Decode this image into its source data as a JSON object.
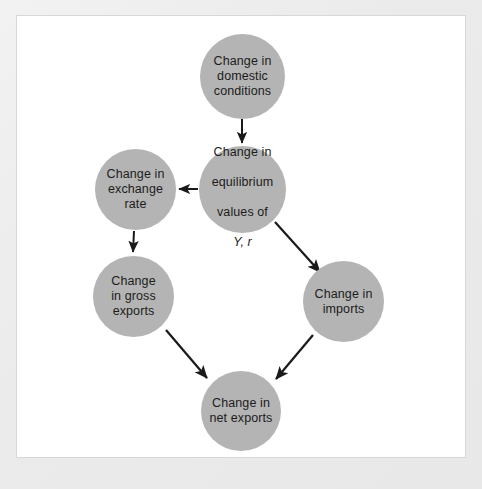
{
  "figure": {
    "type": "flow-diagram",
    "background_color": "#ffffff",
    "frame_color": "#ebebeb",
    "node_fill_color": "#b4b4b4",
    "edge_color": "#1a1a1a",
    "text_color": "#1c1c1c"
  },
  "nodes": [
    {
      "id": "domestic",
      "label": "Change in\ndomestic\nconditions",
      "line1": "Change in",
      "line2": "domestic",
      "line3": "conditions",
      "cx": 242,
      "cy": 76
    },
    {
      "id": "equilibrium",
      "label": "Change in\nequilibrium\nvalues of\nY, r",
      "line1": "Change in",
      "line2": "equilibrium",
      "line3": "values of",
      "line4": "Y, r",
      "cx": 242,
      "cy": 189
    },
    {
      "id": "exchange",
      "label": "Change in\nexchange\nrate",
      "line1": "Change in",
      "line2": "exchange",
      "line3": "rate",
      "cx": 135,
      "cy": 189
    },
    {
      "id": "gross-exports",
      "label": "Change\nin gross\nexports",
      "line1": "Change",
      "line2": "in gross",
      "line3": "exports",
      "cx": 133,
      "cy": 296
    },
    {
      "id": "imports",
      "label": "Change in\nimports",
      "line1": "Change in",
      "line2": "imports",
      "cx": 343,
      "cy": 301
    },
    {
      "id": "net-exports",
      "label": "Change in\nnet exports",
      "line1": "Change in",
      "line2": "net exports",
      "cx": 241,
      "cy": 411
    }
  ],
  "edges": [
    {
      "from": "domestic",
      "to": "equilibrium",
      "direction": "down"
    },
    {
      "from": "equilibrium",
      "to": "exchange",
      "direction": "left"
    },
    {
      "from": "equilibrium",
      "to": "imports",
      "direction": "down-right"
    },
    {
      "from": "exchange",
      "to": "gross-exports",
      "direction": "down"
    },
    {
      "from": "gross-exports",
      "to": "net-exports",
      "direction": "down-right"
    },
    {
      "from": "imports",
      "to": "net-exports",
      "direction": "down-left"
    }
  ]
}
